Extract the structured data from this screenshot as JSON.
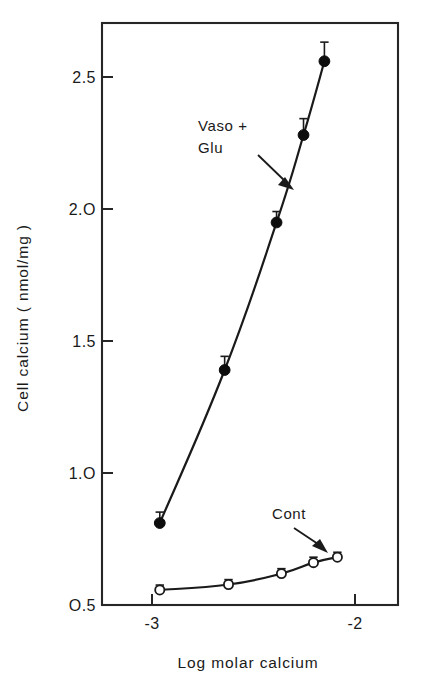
{
  "chart_data": {
    "type": "line",
    "title": "",
    "subtitle": "",
    "xlabel": "Log  molar calcium",
    "ylabel": "Cell calcium ( nmol/mg )",
    "xlim": [
      -3.25,
      -1.79
    ],
    "ylim": [
      0.5,
      2.63
    ],
    "grid": false,
    "legend_position": "inline-annotations",
    "x_ticks": [
      -3,
      -2
    ],
    "x_tick_labels": [
      "-3",
      "-2"
    ],
    "y_ticks": [
      0.5,
      1.0,
      1.5,
      2.0,
      2.5
    ],
    "y_tick_labels": [
      "O.5",
      "1.O",
      "1.5",
      "2.O",
      "2.5"
    ],
    "series": [
      {
        "name": "Vaso + Glu",
        "marker": "filled-circle",
        "x": [
          -2.965,
          -2.645,
          -2.389,
          -2.256,
          -2.153
        ],
        "values": [
          0.8,
          1.36,
          1.9,
          2.22,
          2.49
        ],
        "errors": [
          0.04,
          0.05,
          0.04,
          0.06,
          0.07
        ]
      },
      {
        "name": "Cont",
        "marker": "open-circle",
        "x": [
          -2.965,
          -2.626,
          -2.365,
          -2.207,
          -2.089
        ],
        "values": [
          0.555,
          0.575,
          0.615,
          0.655,
          0.675
        ],
        "errors": [
          0.018,
          0.018,
          0.018,
          0.02,
          0.018
        ]
      }
    ],
    "annotations": [
      {
        "name": "vaso-glu",
        "line1": "Vaso +",
        "line2": "Glu",
        "target_x": -2.33,
        "target_y": 2.03
      },
      {
        "name": "cont",
        "line1": "Cont",
        "line2": "",
        "target_x": -2.225,
        "target_y": 0.735
      }
    ]
  }
}
